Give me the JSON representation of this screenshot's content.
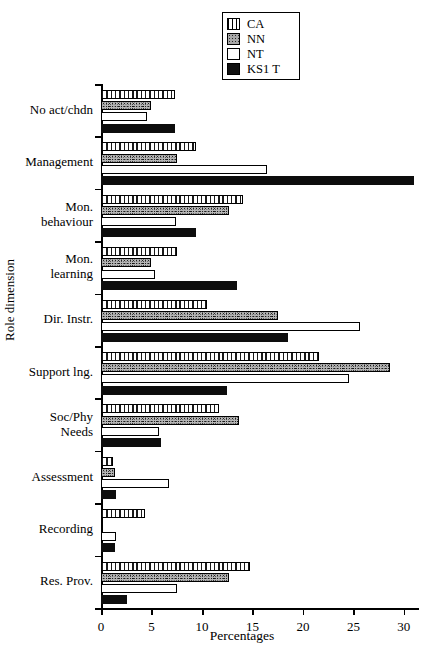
{
  "chart_data": {
    "type": "bar",
    "orientation": "horizontal",
    "title": "",
    "xlabel": "Percentages",
    "ylabel": "Role dimension",
    "xlim": [
      0,
      31.5
    ],
    "xticks": [
      0,
      5,
      10,
      15,
      20,
      25,
      30
    ],
    "xticklabels": [
      "0",
      "5",
      "10",
      "15",
      "20",
      "25",
      "30"
    ],
    "grid": false,
    "legend_position": "top-center",
    "categories": [
      "No act/chdn",
      "Management",
      "Mon.\nbehaviour",
      "Mon.\nlearning",
      "Dir. Instr.",
      "Support lng.",
      "Soc/Phy\nNeeds",
      "Assessment",
      "Recording",
      "Res. Prov."
    ],
    "series": [
      {
        "name": "CA",
        "pattern": "vertical-hatch",
        "values": [
          7.3,
          9.4,
          14.1,
          7.5,
          10.5,
          21.6,
          11.7,
          1.2,
          4.4,
          14.8
        ]
      },
      {
        "name": "NN",
        "pattern": "stipple",
        "values": [
          5.0,
          7.5,
          12.7,
          5.0,
          17.5,
          28.6,
          13.7,
          1.4,
          0.0,
          12.7
        ]
      },
      {
        "name": "NT",
        "pattern": "empty",
        "values": [
          4.6,
          16.4,
          7.4,
          5.3,
          25.7,
          24.6,
          5.7,
          6.7,
          1.5,
          7.5
        ]
      },
      {
        "name": "KS1 T",
        "pattern": "solid-black",
        "values": [
          7.3,
          31.0,
          9.4,
          13.5,
          18.5,
          12.5,
          5.9,
          1.5,
          1.4,
          2.6
        ]
      }
    ]
  },
  "legend": {
    "items": [
      {
        "label": "CA",
        "swatch": "ca"
      },
      {
        "label": "NN",
        "swatch": "nn"
      },
      {
        "label": "NT",
        "swatch": "nt"
      },
      {
        "label": "KS1 T",
        "swatch": "ks"
      }
    ]
  }
}
